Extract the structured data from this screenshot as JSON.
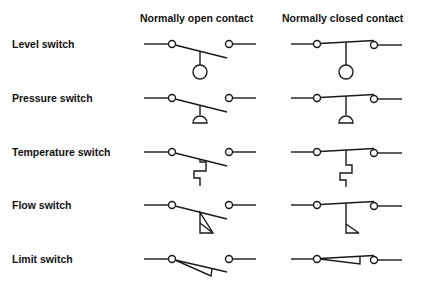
{
  "headers": {
    "normally_open": "Normally open contact",
    "normally_closed": "Normally closed contact"
  },
  "rows": [
    {
      "label": "Level switch",
      "actuator": "float-circle"
    },
    {
      "label": "Pressure switch",
      "actuator": "dome-diaphragm"
    },
    {
      "label": "Temperature switch",
      "actuator": "zigzag-thermal"
    },
    {
      "label": "Flow switch",
      "actuator": "vane-triangle"
    },
    {
      "label": "Limit switch",
      "actuator": "wedge-cam"
    }
  ]
}
